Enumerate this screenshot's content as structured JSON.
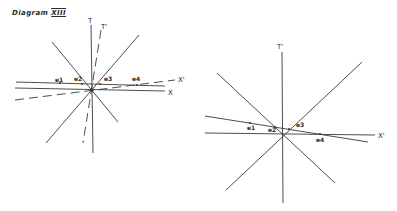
{
  "title": {
    "text": "Diagram",
    "numeral": "XIII"
  },
  "diagrams": [
    {
      "name": "left-diagram",
      "axes": {
        "T": "T",
        "T_prime": "T'",
        "X": "X",
        "X_prime": "X'"
      },
      "events": [
        "e1",
        "e2",
        "e3",
        "e4"
      ]
    },
    {
      "name": "right-diagram",
      "axes": {
        "T_prime": "T'",
        "X_prime": "X'"
      },
      "events": [
        "e1",
        "e2",
        "e3",
        "e4"
      ]
    }
  ],
  "colors": {
    "ink": "#3a3a3a",
    "background": "#ffffff"
  }
}
